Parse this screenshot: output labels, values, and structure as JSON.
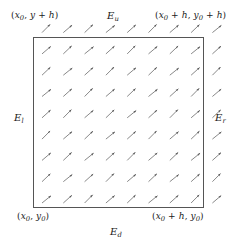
{
  "figure": {
    "background_color": "#ffffff",
    "stroke_color": "#4a4a4a",
    "text_color": "#1a1a1a"
  },
  "square": {
    "x": 33,
    "y": 37,
    "width": 170,
    "height": 170,
    "border_color": "#555555",
    "border_width": 1
  },
  "corner_labels": {
    "top_left": {
      "prefix": "(",
      "x_term": "x",
      "x_sub": "0",
      "sep": ", ",
      "y_term": "y",
      "y_suffix": " + h",
      "close": ")",
      "text": "(x0, y + h)"
    },
    "top_right": {
      "text": "(x0 + h, y0 + h)"
    },
    "bottom_left": {
      "text": "(x0, y0)"
    },
    "bottom_right": {
      "text": "(x0 + h, y0)"
    }
  },
  "edge_labels": {
    "up": {
      "base": "E",
      "sub": "u"
    },
    "down": {
      "base": "E",
      "sub": "d"
    },
    "left": {
      "base": "E",
      "sub": "l"
    },
    "right": {
      "base": "E",
      "sub": "r"
    }
  },
  "vector_field": {
    "type": "quiver",
    "grid_origin_x": 42,
    "grid_origin_y": 203,
    "spacing_x": 21.3,
    "spacing_y": 21.3,
    "columns": 9,
    "rows": 9,
    "arrow_length": 11.5,
    "arrow_angle_deg": 42,
    "arrow_head_length": 3.6,
    "arrow_color": "#555555",
    "arrow_width": 0.7,
    "direction": "up-right"
  },
  "chart_data": {
    "type": "scatter",
    "title": "",
    "xlabel": "",
    "ylabel": ""
  }
}
